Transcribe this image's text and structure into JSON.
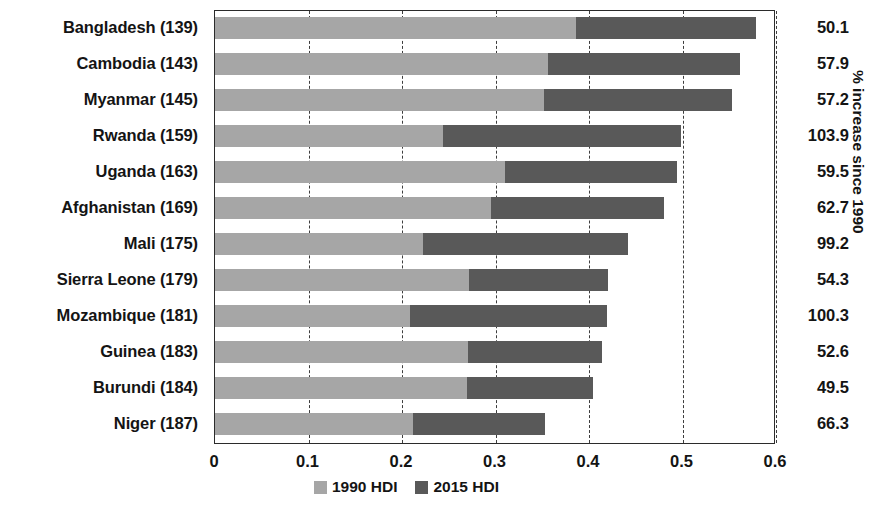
{
  "chart_data": {
    "type": "bar",
    "title": "",
    "subtitle": "",
    "xlabel": "",
    "ylabel": "",
    "right_axis_label": "% increase since 1990",
    "xlim": [
      0,
      0.6
    ],
    "xticks": [
      "0",
      "0.1",
      "0.2",
      "0.3",
      "0.4",
      "0.5",
      "0.6"
    ],
    "xtick_values": [
      0,
      0.1,
      0.2,
      0.3,
      0.4,
      0.5,
      0.6
    ],
    "grid": true,
    "grid_style": "dashed-vertical",
    "orientation": "horizontal",
    "bar_mode": "overlaid-extension",
    "legend": {
      "position": "bottom",
      "entries": [
        {
          "label": "1990 HDI",
          "color": "#a6a6a6"
        },
        {
          "label": "2015 HDI",
          "color": "#595959"
        }
      ]
    },
    "categories": [
      "Bangladesh (139)",
      "Cambodia (143)",
      "Myanmar (145)",
      "Rwanda (159)",
      "Uganda (163)",
      "Afghanistan (169)",
      "Mali (175)",
      "Sierra Leone (179)",
      "Mozambique (181)",
      "Guinea (183)",
      "Burundi (184)",
      "Niger (187)"
    ],
    "series": [
      {
        "name": "1990 HDI",
        "color": "#a6a6a6",
        "values": [
          0.386,
          0.356,
          0.352,
          0.244,
          0.31,
          0.295,
          0.222,
          0.272,
          0.209,
          0.271,
          0.27,
          0.212
        ]
      },
      {
        "name": "2015 HDI",
        "color": "#595959",
        "values": [
          0.579,
          0.562,
          0.553,
          0.498,
          0.494,
          0.48,
          0.442,
          0.42,
          0.419,
          0.414,
          0.404,
          0.353
        ]
      }
    ],
    "right_values": [
      "50.1",
      "57.9",
      "57.2",
      "103.9",
      "59.5",
      "62.7",
      "99.2",
      "54.3",
      "100.3",
      "52.6",
      "49.5",
      "66.3"
    ]
  }
}
